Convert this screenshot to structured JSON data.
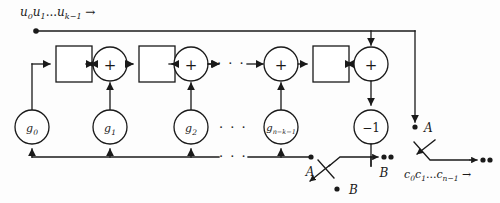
{
  "diagram": {
    "type": "block-diagram",
    "width": 500,
    "height": 203,
    "ink_color": "#1a1a1a",
    "background_color": "#fdfdfd",
    "input_label": "u0u1...uk−1 →",
    "output_label": "c0c1...cn−1 →",
    "ellipsis": "· · ·",
    "top_rail": {
      "name": "message-input-rail",
      "label": "u0u1...uk−1 →"
    },
    "adders": [
      {
        "id": "adder-1",
        "symbol": "+",
        "cx": 110,
        "cy": 64,
        "r": 17
      },
      {
        "id": "adder-2",
        "symbol": "+",
        "cx": 191,
        "cy": 64,
        "r": 17
      },
      {
        "id": "adder-3",
        "symbol": "+",
        "cx": 281,
        "cy": 64,
        "r": 17
      },
      {
        "id": "adder-4",
        "symbol": "+",
        "cx": 371,
        "cy": 64,
        "r": 17
      }
    ],
    "delays": [
      {
        "id": "delay-1",
        "label": "",
        "x": 56,
        "y": 46,
        "w": 36,
        "h": 36
      },
      {
        "id": "delay-2",
        "label": "",
        "x": 139,
        "y": 46,
        "w": 36,
        "h": 36
      },
      {
        "id": "delay-3",
        "label": "",
        "x": 313,
        "y": 46,
        "w": 36,
        "h": 36
      }
    ],
    "multipliers": [
      {
        "id": "tap-g0",
        "label": "g0",
        "sub": "0",
        "cx": 32,
        "cy": 127,
        "r": 17
      },
      {
        "id": "tap-g1",
        "label": "g1",
        "sub": "1",
        "cx": 110,
        "cy": 127,
        "r": 17
      },
      {
        "id": "tap-g2",
        "label": "g2",
        "sub": "2",
        "cx": 191,
        "cy": 127,
        "r": 17
      },
      {
        "id": "tap-gn",
        "label": "gn−k−1",
        "sub": "n−k−1",
        "cx": 281,
        "cy": 127,
        "r": 17
      },
      {
        "id": "tap-minus-one",
        "label": "−1",
        "sub": "",
        "cx": 371,
        "cy": 127,
        "r": 17
      }
    ],
    "switch_labels": [
      {
        "id": "switch-a-left",
        "text": "A",
        "x": 310,
        "y": 174
      },
      {
        "id": "switch-b-left",
        "text": "B",
        "x": 345,
        "y": 194
      },
      {
        "id": "switch-b-right",
        "text": "B",
        "x": 384,
        "y": 176
      },
      {
        "id": "switch-a-right",
        "text": "A",
        "x": 424,
        "y": 128
      }
    ],
    "gate_symbols": {
      "adder": "+",
      "inverter": "−1"
    },
    "legend": {
      "delay_meaning": "delay element",
      "adder_meaning": "modulo-2 adder",
      "multiplier_meaning": "generator polynomial coefficient tap"
    }
  }
}
